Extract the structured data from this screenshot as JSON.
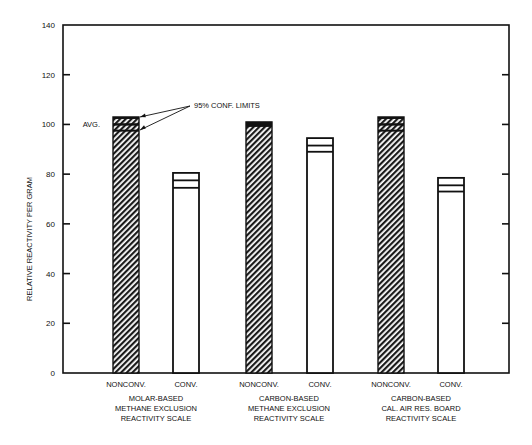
{
  "chart_data": {
    "type": "bar",
    "title": "",
    "xlabel": "",
    "ylabel": "RELATIVE REACTIVITY PER GRAM",
    "ylim": [
      0,
      140
    ],
    "yticks": [
      0,
      20,
      40,
      60,
      80,
      100,
      120,
      140
    ],
    "grid": false,
    "groups": [
      {
        "label_lines": [
          "MOLAR-BASED",
          "METHANE  EXCLUSION",
          "REACTIVITY SCALE"
        ]
      },
      {
        "label_lines": [
          "CARBON-BASED",
          "METHANE  EXCLUSION",
          "REACTIVITY SCALE"
        ]
      },
      {
        "label_lines": [
          "CARBON-BASED",
          "CAL. AIR RES. BOARD",
          "REACTIVITY SCALE"
        ]
      }
    ],
    "categories": [
      "NONCONV.",
      "CONV."
    ],
    "bars": [
      {
        "group": 0,
        "category": "NONCONV.",
        "avg": 100,
        "ci_low": 97.5,
        "ci_high": 103,
        "style": "hatched"
      },
      {
        "group": 0,
        "category": "CONV.",
        "avg": 77.5,
        "ci_low": 74.5,
        "ci_high": 80.5,
        "style": "open"
      },
      {
        "group": 1,
        "category": "NONCONV.",
        "avg": 100,
        "ci_low": 99,
        "ci_high": 101,
        "style": "hatched"
      },
      {
        "group": 1,
        "category": "CONV.",
        "avg": 91.5,
        "ci_low": 89,
        "ci_high": 94.5,
        "style": "open"
      },
      {
        "group": 2,
        "category": "NONCONV.",
        "avg": 100,
        "ci_low": 97.5,
        "ci_high": 103,
        "style": "hatched"
      },
      {
        "group": 2,
        "category": "CONV.",
        "avg": 75.5,
        "ci_low": 73,
        "ci_high": 78.5,
        "style": "open"
      }
    ],
    "annotations": [
      {
        "text": "95% CONF. LIMITS",
        "target_bar": 0
      },
      {
        "text": "AVG.",
        "target_bar": 0
      }
    ]
  },
  "labels": {
    "ylabel": "RELATIVE REACTIVITY PER GRAM",
    "conf_limits": "95% CONF. LIMITS",
    "avg": "AVG.",
    "nonconv": "NONCONV.",
    "conv": "CONV."
  }
}
